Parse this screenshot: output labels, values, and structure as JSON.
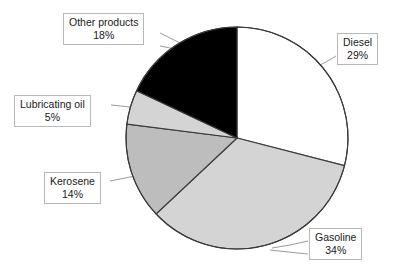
{
  "chart_data": {
    "type": "pie",
    "title": "",
    "xlabel": "",
    "ylabel": "",
    "legend_position": "none",
    "grid": false,
    "start_angle_deg": 0,
    "direction": "clockwise",
    "unit": "%",
    "categories": [
      "Diesel",
      "Gasoline",
      "Kerosene",
      "Lubricating oil",
      "Other products"
    ],
    "values": [
      29,
      34,
      14,
      5,
      18
    ],
    "slices": [
      {
        "label": "Diesel",
        "value": 29,
        "value_text": "29%",
        "color": "#ffffff"
      },
      {
        "label": "Gasoline",
        "value": 34,
        "value_text": "34%",
        "color": "#d4d4d4"
      },
      {
        "label": "Kerosene",
        "value": 14,
        "value_text": "14%",
        "color": "#bdbdbd"
      },
      {
        "label": "Lubricating oil",
        "value": 5,
        "value_text": "5%",
        "color": "#d4d4d4"
      },
      {
        "label": "Other products",
        "value": 18,
        "value_text": "18%",
        "color": "#000000"
      }
    ]
  },
  "callouts": {
    "other_products": {
      "category": "Other products",
      "value_text": "18%"
    },
    "diesel": {
      "category": "Diesel",
      "value_text": "29%"
    },
    "lubricating_oil": {
      "category": "Lubricating oil",
      "value_text": "5%"
    },
    "kerosene": {
      "category": "Kerosene",
      "value_text": "14%"
    },
    "gasoline": {
      "category": "Gasoline",
      "value_text": "34%"
    }
  },
  "style": {
    "outline_color": "#3a3a3a",
    "callout_border_color": "#b8b8b8",
    "leader_color": "#9a9a9a",
    "background": "#ffffff"
  }
}
